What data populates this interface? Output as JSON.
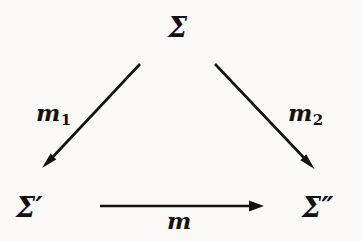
{
  "diagram": {
    "kind": "commutative-triangle",
    "background_color": "#fbfaf8",
    "ink_color": "#14120f",
    "nodes": [
      {
        "id": "apex",
        "label": "Σ",
        "role": "source-object",
        "x": 181,
        "y": 29
      },
      {
        "id": "bottom_left",
        "label": "Σ′",
        "role": "target-object-left",
        "x": 30,
        "y": 209
      },
      {
        "id": "bottom_right",
        "label": "Σ″",
        "role": "target-object-right",
        "x": 320,
        "y": 209
      }
    ],
    "edges": [
      {
        "id": "m1",
        "label": "m",
        "subscript": "1",
        "from": "apex",
        "to": "bottom_left",
        "direction": "down-left",
        "arrowhead": "filled",
        "x1": 140,
        "y1": 64,
        "x2": 44,
        "y2": 166
      },
      {
        "id": "m2",
        "label": "m",
        "subscript": "2",
        "from": "apex",
        "to": "bottom_right",
        "direction": "down-right",
        "arrowhead": "filled",
        "x1": 215,
        "y1": 64,
        "x2": 313,
        "y2": 167
      },
      {
        "id": "m",
        "label": "m",
        "subscript": "",
        "from": "bottom_left",
        "to": "bottom_right",
        "direction": "right",
        "arrowhead": "filled",
        "x1": 100,
        "y1": 206,
        "x2": 264,
        "y2": 206
      }
    ]
  }
}
